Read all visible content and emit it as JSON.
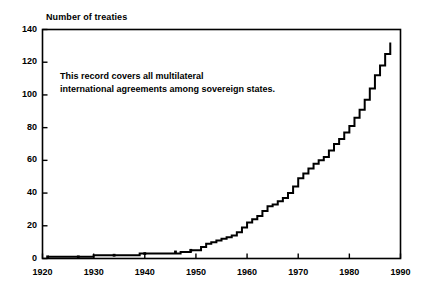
{
  "chart_data": {
    "type": "line",
    "title": "",
    "subtitle": "",
    "ylabel": "Number of treaties",
    "xlabel": "",
    "xlim": [
      1920,
      1990
    ],
    "ylim": [
      0,
      140
    ],
    "xticks": [
      1920,
      1930,
      1940,
      1950,
      1960,
      1970,
      1980,
      1990
    ],
    "ytick_labels": [
      "0",
      "20",
      "40",
      "60",
      "80",
      "100",
      "120",
      "140"
    ],
    "yticks": [
      0,
      20,
      40,
      60,
      80,
      100,
      120,
      140
    ],
    "grid": false,
    "legend": "none",
    "line_style": "step-post",
    "line_color": "#000000",
    "annotations": [
      {
        "text": "This record covers all multilateral\ninternational agreements among sovereign states.",
        "x": 1927,
        "y": 110
      }
    ],
    "x": [
      1921,
      1924,
      1927,
      1930,
      1933,
      1936,
      1939,
      1942,
      1945,
      1947,
      1949,
      1950,
      1951,
      1952,
      1953,
      1954,
      1955,
      1956,
      1957,
      1958,
      1959,
      1960,
      1961,
      1962,
      1963,
      1964,
      1965,
      1966,
      1967,
      1968,
      1969,
      1970,
      1971,
      1972,
      1973,
      1974,
      1975,
      1976,
      1977,
      1978,
      1979,
      1980,
      1981,
      1982,
      1983,
      1984,
      1985,
      1986,
      1987,
      1988
    ],
    "values": [
      1,
      1,
      1,
      2,
      2,
      2,
      3,
      3,
      3,
      4,
      5,
      5,
      7,
      9,
      10,
      11,
      12,
      13,
      14,
      16,
      19,
      22,
      24,
      26,
      29,
      32,
      33,
      35,
      37,
      40,
      44,
      49,
      52,
      55,
      58,
      60,
      62,
      66,
      70,
      73,
      77,
      81,
      86,
      91,
      97,
      104,
      112,
      118,
      125,
      132
    ],
    "markers": [
      {
        "x": 1921,
        "y": 1
      },
      {
        "x": 1927,
        "y": 1
      },
      {
        "x": 1934,
        "y": 2
      },
      {
        "x": 1940,
        "y": 3
      },
      {
        "x": 1946,
        "y": 4
      },
      {
        "x": 1949,
        "y": 5
      }
    ]
  }
}
